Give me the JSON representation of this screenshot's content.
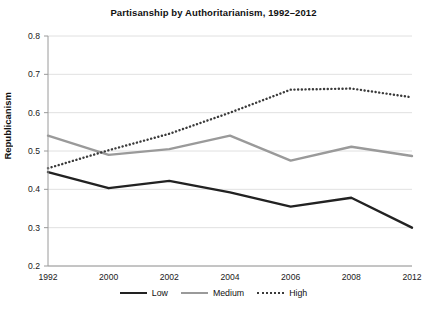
{
  "chart_data": {
    "type": "line",
    "title": "Partisanship by Authoritarianism, 1992–2012",
    "xlabel": "",
    "ylabel": "Republicanism",
    "categories": [
      "1992",
      "2000",
      "2002",
      "2004",
      "2006",
      "2008",
      "2012"
    ],
    "ylim": [
      0.2,
      0.8
    ],
    "yticks": [
      "0.2",
      "0.3",
      "0.4",
      "0.5",
      "0.6",
      "0.7",
      "0.8"
    ],
    "grid": true,
    "legend_position": "bottom",
    "series": [
      {
        "name": "Low",
        "style": "solid",
        "color": "#222222",
        "values": [
          0.445,
          0.403,
          0.422,
          0.392,
          0.355,
          0.378,
          0.3
        ]
      },
      {
        "name": "Medium",
        "style": "solid",
        "color": "#9a9a9a",
        "values": [
          0.54,
          0.49,
          0.505,
          0.54,
          0.475,
          0.511,
          0.487
        ]
      },
      {
        "name": "High",
        "style": "dotted",
        "color": "#3a3a3a",
        "values": [
          0.455,
          0.502,
          0.545,
          0.6,
          0.66,
          0.663,
          0.64
        ]
      }
    ]
  },
  "legend": {
    "items": [
      {
        "label": "Low"
      },
      {
        "label": "Medium"
      },
      {
        "label": "High"
      }
    ]
  }
}
